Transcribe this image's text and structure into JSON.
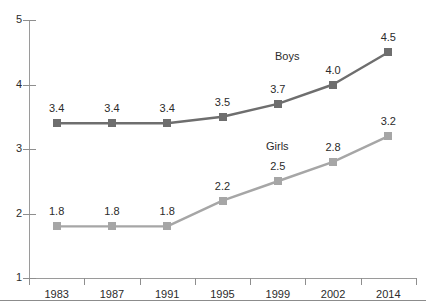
{
  "chart_data": {
    "type": "line",
    "title": "",
    "subtitle": "",
    "xlabel": "",
    "ylabel": "",
    "categories": [
      "1983",
      "1987",
      "1991",
      "1995",
      "1999",
      "2002",
      "2014"
    ],
    "ylim": [
      1,
      5
    ],
    "ytick_labels": [
      "5",
      "4",
      "3",
      "2",
      "1"
    ],
    "ytick_values": [
      5,
      4,
      3,
      2,
      1
    ],
    "grid": false,
    "legend_position": "inline-annotation",
    "series": [
      {
        "name": "Boys",
        "color": "#6e6e6e",
        "marker": "square",
        "values": [
          3.4,
          3.4,
          3.4,
          3.5,
          3.7,
          4.0,
          4.5
        ],
        "labels": [
          "3.4",
          "3.4",
          "3.4",
          "3.5",
          "3.7",
          "4.0",
          "4.5"
        ],
        "annotation": {
          "text": "Boys",
          "x_px": 275,
          "y_px": 50
        }
      },
      {
        "name": "Girls",
        "color": "#a6a6a6",
        "marker": "square",
        "values": [
          1.8,
          1.8,
          1.8,
          2.2,
          2.5,
          2.8,
          3.2
        ],
        "labels": [
          "1.8",
          "1.8",
          "1.8",
          "2.2",
          "2.5",
          "2.8",
          "3.2"
        ],
        "annotation": {
          "text": "Girls",
          "x_px": 266,
          "y_px": 140
        }
      }
    ]
  },
  "colors": {
    "axis": "#9a9a9a",
    "text": "#2b2b2b",
    "background": "#ffffff",
    "boys": "#6e6e6e",
    "girls": "#a6a6a6",
    "footer_rule": "#8c8c8c"
  }
}
